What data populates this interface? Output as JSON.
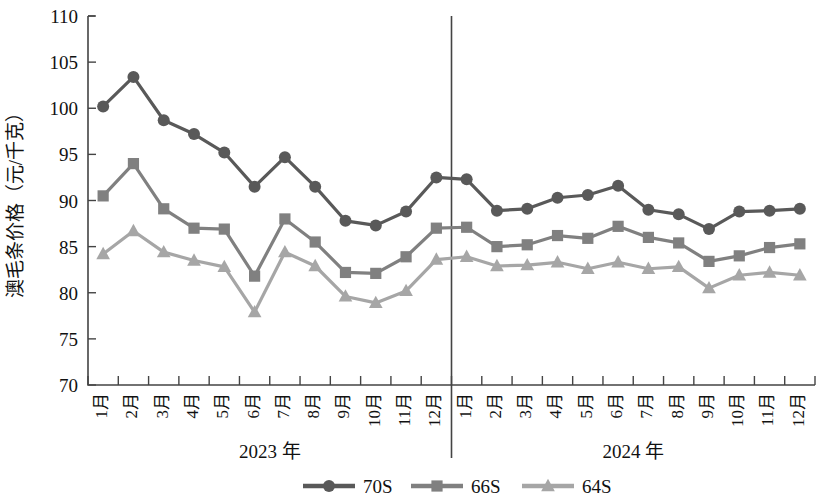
{
  "chart_data": {
    "type": "line",
    "title": "",
    "xlabel": "",
    "ylabel": "澳毛条价格（元/千克）",
    "ylim": [
      70,
      110
    ],
    "ytick_values": [
      70,
      75,
      80,
      85,
      90,
      95,
      100,
      105,
      110
    ],
    "ytick_labels": [
      "70",
      "75",
      "80",
      "85",
      "90",
      "95",
      "100",
      "105",
      "110"
    ],
    "grid": false,
    "legend_position": "bottom",
    "categories": [
      "1月",
      "2月",
      "3月",
      "4月",
      "5月",
      "6月",
      "7月",
      "8月",
      "9月",
      "10月",
      "11月",
      "12月",
      "1月",
      "2月",
      "3月",
      "4月",
      "5月",
      "6月",
      "7月",
      "8月",
      "9月",
      "10月",
      "11月",
      "12月"
    ],
    "group_labels": [
      {
        "label": "2023 年",
        "start_index": 0,
        "end_index": 11
      },
      {
        "label": "2024 年",
        "start_index": 12,
        "end_index": 23
      }
    ],
    "group_divider_after_index": 11,
    "series": [
      {
        "name": "70S",
        "color": "#595959",
        "marker": "circle",
        "values": [
          100.2,
          103.4,
          98.7,
          97.2,
          95.2,
          91.5,
          94.7,
          91.5,
          87.8,
          87.3,
          88.8,
          92.5,
          92.3,
          88.9,
          89.1,
          90.3,
          90.6,
          91.6,
          89.0,
          88.5,
          86.9,
          88.8,
          88.9,
          89.1
        ]
      },
      {
        "name": "66S",
        "color": "#808080",
        "marker": "square",
        "values": [
          90.5,
          94.0,
          89.1,
          87.0,
          86.9,
          81.8,
          88.0,
          85.5,
          82.2,
          82.1,
          83.9,
          87.0,
          87.1,
          85.0,
          85.2,
          86.2,
          85.9,
          87.2,
          86.0,
          85.4,
          83.4,
          84.0,
          84.9,
          85.3
        ]
      },
      {
        "name": "64S",
        "color": "#a6a6a6",
        "marker": "triangle",
        "values": [
          84.2,
          86.7,
          84.4,
          83.5,
          82.8,
          77.9,
          84.4,
          82.9,
          79.6,
          78.9,
          80.2,
          83.6,
          83.9,
          82.9,
          83.0,
          83.3,
          82.6,
          83.3,
          82.6,
          82.8,
          80.5,
          81.9,
          82.2,
          81.9
        ]
      }
    ],
    "legend": [
      {
        "label": "70S",
        "color": "#595959",
        "marker": "circle"
      },
      {
        "label": "66S",
        "color": "#808080",
        "marker": "square"
      },
      {
        "label": "64S",
        "color": "#a6a6a6",
        "marker": "triangle"
      }
    ]
  }
}
